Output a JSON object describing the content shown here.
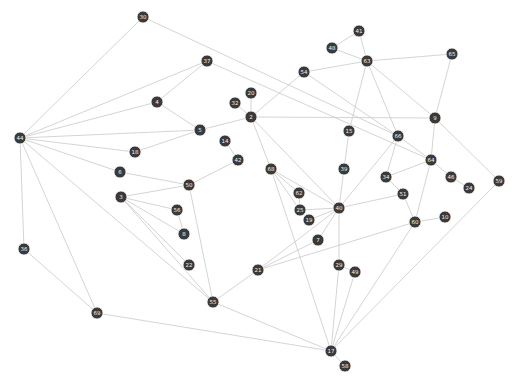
{
  "graph": {
    "type": "network",
    "title": "",
    "node_color": "#3a3a3a",
    "label_color": "#f0f0f0",
    "edge_color": "#c9c9c9",
    "nodes": [
      {
        "id": "30"
      },
      {
        "id": "37"
      },
      {
        "id": "4"
      },
      {
        "id": "5"
      },
      {
        "id": "44"
      },
      {
        "id": "18"
      },
      {
        "id": "6"
      },
      {
        "id": "50"
      },
      {
        "id": "3"
      },
      {
        "id": "56"
      },
      {
        "id": "8"
      },
      {
        "id": "22"
      },
      {
        "id": "55"
      },
      {
        "id": "36"
      },
      {
        "id": "69"
      },
      {
        "id": "14"
      },
      {
        "id": "42"
      },
      {
        "id": "32"
      },
      {
        "id": "20"
      },
      {
        "id": "2"
      },
      {
        "id": "54"
      },
      {
        "id": "41"
      },
      {
        "id": "48"
      },
      {
        "id": "63"
      },
      {
        "id": "65"
      },
      {
        "id": "9"
      },
      {
        "id": "15"
      },
      {
        "id": "66"
      },
      {
        "id": "64"
      },
      {
        "id": "39"
      },
      {
        "id": "34"
      },
      {
        "id": "51"
      },
      {
        "id": "46"
      },
      {
        "id": "24"
      },
      {
        "id": "59"
      },
      {
        "id": "68"
      },
      {
        "id": "62"
      },
      {
        "id": "25"
      },
      {
        "id": "19"
      },
      {
        "id": "40"
      },
      {
        "id": "7"
      },
      {
        "id": "60"
      },
      {
        "id": "10"
      },
      {
        "id": "21"
      },
      {
        "id": "29"
      },
      {
        "id": "49"
      },
      {
        "id": "17"
      },
      {
        "id": "58"
      }
    ],
    "edges": [
      [
        "44",
        "30"
      ],
      [
        "44",
        "37"
      ],
      [
        "44",
        "4"
      ],
      [
        "44",
        "5"
      ],
      [
        "44",
        "18"
      ],
      [
        "44",
        "6"
      ],
      [
        "44",
        "55"
      ],
      [
        "44",
        "36"
      ],
      [
        "44",
        "69"
      ],
      [
        "36",
        "69"
      ],
      [
        "69",
        "17"
      ],
      [
        "30",
        "66"
      ],
      [
        "37",
        "4"
      ],
      [
        "37",
        "64"
      ],
      [
        "4",
        "5"
      ],
      [
        "5",
        "2"
      ],
      [
        "18",
        "5"
      ],
      [
        "6",
        "50"
      ],
      [
        "3",
        "50"
      ],
      [
        "3",
        "56"
      ],
      [
        "3",
        "8"
      ],
      [
        "3",
        "22"
      ],
      [
        "3",
        "55"
      ],
      [
        "56",
        "8"
      ],
      [
        "50",
        "55"
      ],
      [
        "42",
        "50"
      ],
      [
        "14",
        "42"
      ],
      [
        "55",
        "21"
      ],
      [
        "55",
        "17"
      ],
      [
        "20",
        "2"
      ],
      [
        "32",
        "2"
      ],
      [
        "2",
        "54"
      ],
      [
        "2",
        "9"
      ],
      [
        "2",
        "68"
      ],
      [
        "2",
        "40"
      ],
      [
        "54",
        "63"
      ],
      [
        "54",
        "66"
      ],
      [
        "41",
        "48"
      ],
      [
        "41",
        "63"
      ],
      [
        "48",
        "63"
      ],
      [
        "63",
        "65"
      ],
      [
        "63",
        "9"
      ],
      [
        "63",
        "66"
      ],
      [
        "63",
        "15"
      ],
      [
        "65",
        "9"
      ],
      [
        "15",
        "39"
      ],
      [
        "39",
        "40"
      ],
      [
        "9",
        "64"
      ],
      [
        "9",
        "59"
      ],
      [
        "66",
        "64"
      ],
      [
        "66",
        "34"
      ],
      [
        "66",
        "40"
      ],
      [
        "64",
        "34"
      ],
      [
        "64",
        "46"
      ],
      [
        "64",
        "60"
      ],
      [
        "46",
        "24"
      ],
      [
        "34",
        "51"
      ],
      [
        "51",
        "40"
      ],
      [
        "51",
        "60"
      ],
      [
        "60",
        "10"
      ],
      [
        "60",
        "21"
      ],
      [
        "60",
        "17"
      ],
      [
        "59",
        "17"
      ],
      [
        "68",
        "62"
      ],
      [
        "68",
        "25"
      ],
      [
        "68",
        "40"
      ],
      [
        "68",
        "17"
      ],
      [
        "62",
        "25"
      ],
      [
        "25",
        "40"
      ],
      [
        "19",
        "40"
      ],
      [
        "7",
        "40"
      ],
      [
        "21",
        "40"
      ],
      [
        "21",
        "7"
      ],
      [
        "40",
        "29"
      ],
      [
        "29",
        "49"
      ],
      [
        "29",
        "17"
      ],
      [
        "49",
        "17"
      ],
      [
        "17",
        "58"
      ]
    ]
  }
}
